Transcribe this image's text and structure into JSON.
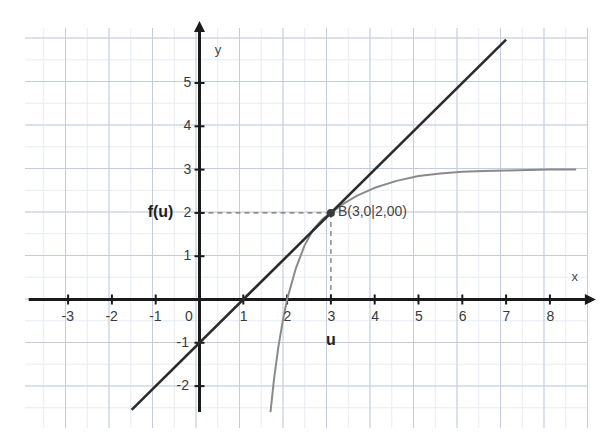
{
  "chart_data": {
    "type": "line",
    "title": "",
    "xlabel": "x",
    "ylabel": "y",
    "xlim": [
      -3.9,
      8.6
    ],
    "ylim": [
      -2.6,
      6.1
    ],
    "grid": true,
    "legend": null,
    "x_ticks": [
      -3,
      -2,
      -1,
      0,
      1,
      2,
      3,
      4,
      5,
      6,
      7,
      8
    ],
    "x_tick_labels": [
      "-3",
      "-2",
      "-1",
      "0",
      "1",
      "2",
      "3",
      "4",
      "5",
      "6",
      "7",
      "8"
    ],
    "x_tick_labels_shown": [
      "-3",
      "-2",
      "-1",
      "0",
      "1",
      "2",
      "3",
      "4",
      "5",
      "6",
      "7",
      "8"
    ],
    "y_ticks": [
      -2,
      -1,
      1,
      2,
      3,
      4,
      5
    ],
    "y_tick_labels": [
      "-2",
      "-1",
      "1",
      "2",
      "3",
      "4",
      "5"
    ],
    "series": [
      {
        "name": "tangent-line",
        "type": "line",
        "color": "#2b2b2b",
        "equation": "y = x - 1",
        "x": [
          -1.55,
          7.0
        ],
        "y": [
          -2.55,
          6.0
        ],
        "points_of_interest": [
          {
            "label": "x-intercept",
            "x": 1,
            "y": 0
          },
          {
            "label": "y-intercept",
            "x": 0,
            "y": -1
          }
        ]
      },
      {
        "name": "logarithmic-curve",
        "type": "curve",
        "color": "#8a8a8a",
        "asymptote_horizontal": 3,
        "x": [
          1.62,
          1.7,
          1.8,
          1.9,
          2.0,
          2.2,
          2.4,
          2.6,
          2.8,
          3.0,
          3.3,
          3.6,
          4.0,
          4.5,
          5.0,
          5.5,
          6.0,
          6.5,
          7.0,
          7.5,
          8.0,
          8.6
        ],
        "y": [
          -2.6,
          -1.85,
          -1.1,
          -0.5,
          0.0,
          0.72,
          1.25,
          1.62,
          1.85,
          2.0,
          2.22,
          2.4,
          2.58,
          2.74,
          2.85,
          2.91,
          2.95,
          2.97,
          2.98,
          2.99,
          3.0,
          3.0
        ],
        "points_of_interest": [
          {
            "label": "x-intercept",
            "x": 2,
            "y": 0
          }
        ]
      }
    ],
    "marked_point": {
      "label": "B(3,0|2,00)",
      "x": 3,
      "y": 2,
      "color": "#3a3a3a",
      "guide_lines": "dashed"
    },
    "annotations": [
      {
        "name": "f-of-u-label",
        "text": "f(u)",
        "x": -1.0,
        "y": 2,
        "bold": true
      },
      {
        "name": "u-label",
        "text": "u",
        "x": 3,
        "y": -0.95,
        "bold": true
      },
      {
        "name": "x-axis-name",
        "text": "x",
        "x": 8.45,
        "y": 0.5
      },
      {
        "name": "y-axis-name",
        "text": "y",
        "x": 0.3,
        "y": 5.75
      }
    ]
  },
  "axes": {
    "x_name": "x",
    "y_name": "y",
    "x_tick_labels": [
      "-3",
      "-2",
      "-1",
      "0",
      "1",
      "2",
      "3",
      "4",
      "5",
      "6",
      "7",
      "8"
    ],
    "y_tick_labels": [
      "5",
      "4",
      "3",
      "2",
      "1",
      "-1",
      "-2"
    ]
  },
  "labels": {
    "f_of_u": "f(u)",
    "u": "u",
    "point_b": "B(3,0|2,00)"
  },
  "colors": {
    "line": "#2b2b2b",
    "curve": "#8a8a8a",
    "grid_major": "#b9c4d6",
    "grid_minor": "#e3e9f2",
    "axis": "#1a1a1a",
    "text": "#3a3a3a",
    "background": "#ffffff"
  }
}
